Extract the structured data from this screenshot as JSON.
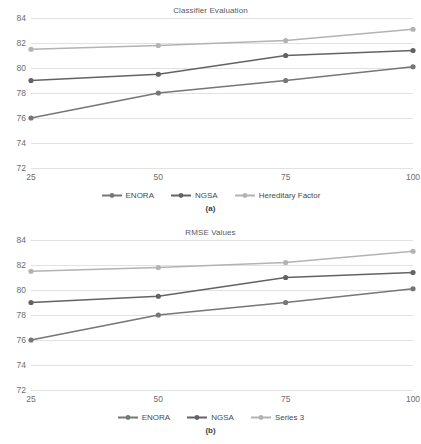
{
  "figure": {
    "background": "#ffffff",
    "panels": [
      {
        "caption": "(a)",
        "chart_data": {
          "type": "line",
          "title": "Classifier Evaluation",
          "xlabel": "",
          "ylabel": "",
          "categories": [
            "25",
            "50",
            "75",
            "100"
          ],
          "x": [
            25,
            50,
            75,
            100
          ],
          "ylim": [
            72,
            84
          ],
          "yticks": [
            "72",
            "74",
            "76",
            "78",
            "80",
            "82",
            "84"
          ],
          "grid": true,
          "legend_position": "bottom",
          "series": [
            {
              "name": "ENORA",
              "color": "#767676",
              "values": [
                76.0,
                78.0,
                79.0,
                80.1
              ]
            },
            {
              "name": "NGSA",
              "color": "#636363",
              "values": [
                79.0,
                79.5,
                81.0,
                81.4
              ]
            },
            {
              "name": "Hereditary Factor",
              "color": "#b3b3b3",
              "values": [
                81.5,
                81.8,
                82.2,
                83.1
              ]
            }
          ]
        }
      },
      {
        "caption": "(b)",
        "chart_data": {
          "type": "line",
          "title": "RMSE Values",
          "xlabel": "",
          "ylabel": "",
          "categories": [
            "25",
            "50",
            "75",
            "100"
          ],
          "x": [
            25,
            50,
            75,
            100
          ],
          "ylim": [
            72,
            84
          ],
          "yticks": [
            "72",
            "74",
            "76",
            "78",
            "80",
            "82",
            "84"
          ],
          "grid": true,
          "legend_position": "bottom",
          "series": [
            {
              "name": "ENORA",
              "color": "#767676",
              "values": [
                76.0,
                78.0,
                79.0,
                80.1
              ]
            },
            {
              "name": "NGSA",
              "color": "#636363",
              "values": [
                79.0,
                79.5,
                81.0,
                81.4
              ]
            },
            {
              "name": "Series 3",
              "color": "#b3b3b3",
              "values": [
                81.5,
                81.8,
                82.2,
                83.1
              ]
            }
          ]
        }
      }
    ]
  }
}
